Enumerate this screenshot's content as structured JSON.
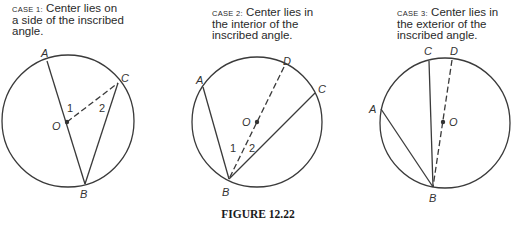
{
  "cases": [
    {
      "case_label": "CASE 1:",
      "text_lines": [
        "Center lies on",
        "a side of the inscribed",
        "angle."
      ],
      "points": {
        "A": "A",
        "B": "B",
        "C": "C",
        "O": "O"
      },
      "angles": [
        "1",
        "2"
      ]
    },
    {
      "case_label": "CASE 2:",
      "text_lines": [
        "Center lies in",
        "the interior of the",
        "inscribed angle."
      ],
      "points": {
        "A": "A",
        "B": "B",
        "C": "C",
        "D": "D",
        "O": "O"
      },
      "angles": [
        "1",
        "2"
      ]
    },
    {
      "case_label": "CASE 3:",
      "text_lines": [
        "Center lies in",
        "the exterior of the",
        "inscribed angle."
      ],
      "points": {
        "A": "A",
        "B": "B",
        "C": "C",
        "D": "D",
        "O": "O"
      }
    }
  ],
  "figure_title": "FIGURE 12.22",
  "colors": {
    "stroke": "#3a3a3a",
    "text": "#2a2a2a"
  }
}
